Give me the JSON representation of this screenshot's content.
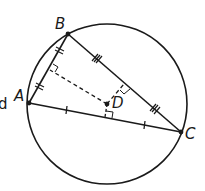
{
  "diagram": {
    "type": "geometry",
    "colors": {
      "stroke": "#1a1a1a",
      "background": "#ffffff"
    },
    "circle": {
      "cx": 107,
      "cy": 104,
      "r": 80
    },
    "points": {
      "A": {
        "label": "A",
        "x": 29,
        "y": 103
      },
      "B": {
        "label": "B",
        "x": 68,
        "y": 34
      },
      "C": {
        "label": "C",
        "x": 181,
        "y": 132
      },
      "D": {
        "label": "D",
        "x": 107,
        "y": 104
      }
    },
    "segments": [
      {
        "name": "AB",
        "from": "A",
        "to": "B",
        "ticks": 2
      },
      {
        "name": "BC",
        "from": "B",
        "to": "C",
        "ticks": 3
      },
      {
        "name": "AC",
        "from": "A",
        "to": "C",
        "ticks": 1
      }
    ],
    "perpendiculars": [
      {
        "to_side": "AB",
        "foot": {
          "x": 49,
          "y": 69
        },
        "style": "dashed"
      },
      {
        "to_side": "BC",
        "foot": {
          "x": 125,
          "y": 83
        },
        "style": "dashed"
      },
      {
        "to_side": "AC",
        "foot": {
          "x": 105,
          "y": 117
        },
        "style": "dashed"
      }
    ],
    "clipped_text": "d"
  }
}
